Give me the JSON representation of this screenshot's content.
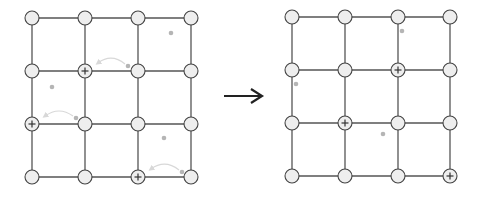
{
  "diagram": {
    "type": "grid-transition",
    "grid_size": "4x4",
    "colors": {
      "edge": "#555555",
      "node_fill": "#eeeeee",
      "node_stroke": "#444444",
      "marker": "#333333",
      "dot": "#b5b5b5",
      "move_arrow": "#d8d8d8",
      "transition_arrow": "#222222"
    },
    "left_grid": {
      "cols": [
        32,
        85,
        138,
        191
      ],
      "rows": [
        18,
        71,
        124,
        177
      ],
      "marked_nodes": [
        [
          1,
          1
        ],
        [
          0,
          2
        ],
        [
          2,
          3
        ]
      ],
      "dots": [
        [
          171,
          33
        ],
        [
          52,
          87
        ],
        [
          164,
          138
        ],
        [
          128,
          66
        ],
        [
          76,
          118
        ],
        [
          182,
          172
        ]
      ],
      "move_arrows": [
        {
          "from": [
            128,
            66
          ],
          "to": [
            95,
            64
          ]
        },
        {
          "from": [
            76,
            118
          ],
          "to": [
            42,
            117
          ]
        },
        {
          "from": [
            182,
            172
          ],
          "to": [
            148,
            170
          ]
        }
      ]
    },
    "right_grid": {
      "cols": [
        292,
        345,
        398,
        450
      ],
      "rows": [
        17,
        70,
        123,
        176
      ],
      "marked_nodes": [
        [
          2,
          1
        ],
        [
          1,
          2
        ],
        [
          3,
          3
        ]
      ],
      "dots": [
        [
          402,
          31
        ],
        [
          296,
          84
        ],
        [
          383,
          134
        ]
      ]
    },
    "transition_arrow": {
      "from": [
        224,
        96
      ],
      "to": [
        262,
        96
      ],
      "label": "transition-arrow"
    }
  }
}
